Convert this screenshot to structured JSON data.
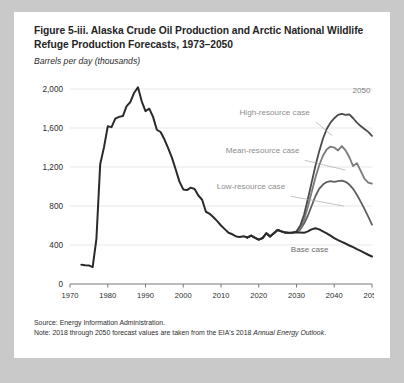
{
  "figure": {
    "title": "Figure 5-iii. Alaska Crude Oil Production and Arctic National Wildlife Refuge Production Forecasts, 1973–2050",
    "subtitle": "Barrels per day (thousands)",
    "source_line": "Source: Energy Information Administration.",
    "note_prefix": "Note: 2018 through 2050 forecast values are taken from the EIA's 2018 ",
    "note_italic": "Annual Energy Outlook",
    "note_suffix": ".",
    "end_year_label": "2050"
  },
  "chart_data": {
    "type": "line",
    "title": "Figure 5-iii. Alaska Crude Oil Production and Arctic National Wildlife Refuge Production Forecasts, 1973–2050",
    "xlabel": "",
    "ylabel": "Barrels per day (thousands)",
    "xlim": [
      1970,
      2050
    ],
    "ylim": [
      0,
      2000
    ],
    "xticks": [
      1970,
      1980,
      1990,
      2000,
      2010,
      2020,
      2030,
      2040,
      2050
    ],
    "yticks": [
      0,
      400,
      800,
      1200,
      1600,
      2000
    ],
    "ytick_labels": [
      "0",
      "400",
      "800",
      "1,200",
      "1,600",
      "2,000"
    ],
    "grid": true,
    "legend": "annotations-inline",
    "annotations": [
      {
        "label": "High-resource case",
        "x": 2034,
        "y": 1730
      },
      {
        "label": "Mean-resource case",
        "x": 2031,
        "y": 1330
      },
      {
        "label": "Low-resource case",
        "x": 2027,
        "y": 960
      },
      {
        "label": "Base case",
        "x": 2037,
        "y": 330
      },
      {
        "label": "2050",
        "x": 2047,
        "y": 1960
      }
    ],
    "series": [
      {
        "name": "Historical",
        "color": "#2a2a2a",
        "x": [
          1973,
          1974,
          1975,
          1976,
          1977,
          1978,
          1979,
          1980,
          1981,
          1982,
          1983,
          1984,
          1985,
          1986,
          1987,
          1988,
          1989,
          1990,
          1991,
          1992,
          1993,
          1994,
          1995,
          1996,
          1997,
          1998,
          1999,
          2000,
          2001,
          2002,
          2003,
          2004,
          2005,
          2006,
          2007,
          2008,
          2009,
          2010,
          2011,
          2012,
          2013,
          2014,
          2015,
          2016,
          2017
        ],
        "y": [
          198,
          193,
          191,
          173,
          464,
          1229,
          1401,
          1617,
          1609,
          1696,
          1714,
          1722,
          1825,
          1867,
          1962,
          2017,
          1874,
          1773,
          1798,
          1714,
          1582,
          1559,
          1484,
          1393,
          1296,
          1175,
          1050,
          970,
          963,
          988,
          974,
          908,
          864,
          741,
          720,
          684,
          645,
          600,
          563,
          526,
          510,
          488,
          483,
          490,
          477
        ]
      },
      {
        "name": "Base case",
        "color": "#2a2a2a",
        "x": [
          2017,
          2018,
          2019,
          2020,
          2021,
          2022,
          2023,
          2024,
          2025,
          2026,
          2027,
          2028,
          2029,
          2030,
          2031,
          2032,
          2033,
          2034,
          2035,
          2036,
          2037,
          2038,
          2039,
          2040,
          2041,
          2042,
          2043,
          2044,
          2045,
          2046,
          2047,
          2048,
          2049,
          2050
        ],
        "y": [
          477,
          496,
          474,
          455,
          470,
          520,
          487,
          520,
          555,
          540,
          528,
          525,
          527,
          531,
          528,
          525,
          540,
          560,
          572,
          560,
          540,
          520,
          496,
          470,
          450,
          432,
          415,
          395,
          378,
          358,
          340,
          320,
          300,
          282
        ]
      },
      {
        "name": "Low-resource case",
        "color": "#5f5f5f",
        "x": [
          2017,
          2018,
          2019,
          2020,
          2021,
          2022,
          2023,
          2024,
          2025,
          2026,
          2027,
          2028,
          2029,
          2030,
          2031,
          2032,
          2033,
          2034,
          2035,
          2036,
          2037,
          2038,
          2039,
          2040,
          2041,
          2042,
          2043,
          2044,
          2045,
          2046,
          2047,
          2048,
          2049,
          2050
        ],
        "y": [
          477,
          496,
          474,
          455,
          470,
          520,
          487,
          520,
          555,
          540,
          528,
          525,
          527,
          534,
          560,
          620,
          700,
          800,
          900,
          975,
          1020,
          1045,
          1055,
          1048,
          1055,
          1060,
          1048,
          1020,
          975,
          915,
          845,
          770,
          690,
          608
        ]
      },
      {
        "name": "Mean-resource case",
        "color": "#7a7a7a",
        "x": [
          2017,
          2018,
          2019,
          2020,
          2021,
          2022,
          2023,
          2024,
          2025,
          2026,
          2027,
          2028,
          2029,
          2030,
          2031,
          2032,
          2033,
          2034,
          2035,
          2036,
          2037,
          2038,
          2039,
          2040,
          2041,
          2042,
          2043,
          2044,
          2045,
          2046,
          2047,
          2048,
          2049,
          2050
        ],
        "y": [
          477,
          496,
          474,
          455,
          470,
          520,
          487,
          520,
          555,
          540,
          528,
          525,
          527,
          534,
          570,
          660,
          790,
          940,
          1090,
          1215,
          1315,
          1380,
          1410,
          1400,
          1370,
          1415,
          1370,
          1300,
          1210,
          1240,
          1160,
          1080,
          1040,
          1030
        ]
      },
      {
        "name": "High-resource case",
        "color": "#4a4a4a",
        "x": [
          2017,
          2018,
          2019,
          2020,
          2021,
          2022,
          2023,
          2024,
          2025,
          2026,
          2027,
          2028,
          2029,
          2030,
          2031,
          2032,
          2033,
          2034,
          2035,
          2036,
          2037,
          2038,
          2039,
          2040,
          2041,
          2042,
          2043,
          2044,
          2045,
          2046,
          2047,
          2048,
          2049,
          2050
        ],
        "y": [
          477,
          496,
          474,
          455,
          470,
          520,
          487,
          520,
          555,
          540,
          528,
          525,
          527,
          540,
          600,
          710,
          870,
          1040,
          1210,
          1360,
          1490,
          1590,
          1655,
          1700,
          1735,
          1745,
          1735,
          1740,
          1700,
          1655,
          1620,
          1590,
          1560,
          1520
        ]
      }
    ]
  }
}
